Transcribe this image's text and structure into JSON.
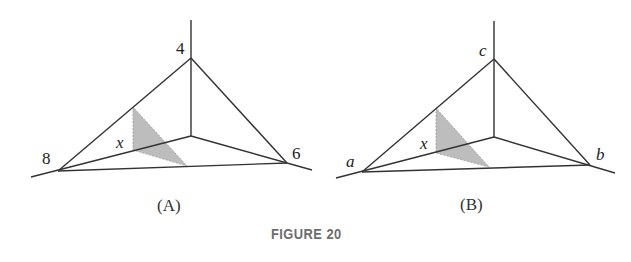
{
  "figure": {
    "caption": "FIGURE 20",
    "panels": [
      {
        "id": "A",
        "label": "(A)",
        "vertex_labels": {
          "top": "4",
          "left": "8",
          "right": "6",
          "slice": "x"
        }
      },
      {
        "id": "B",
        "label": "(B)",
        "vertex_labels": {
          "top": "c",
          "left": "a",
          "right": "b",
          "slice": "x"
        }
      }
    ],
    "colors": {
      "line": "#333333",
      "shade": "#b9b9b9",
      "caption": "#6d6d6d"
    }
  }
}
